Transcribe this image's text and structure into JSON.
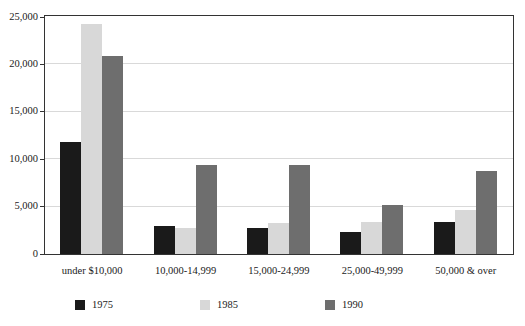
{
  "chart_data": {
    "type": "bar",
    "title": "",
    "xlabel": "",
    "ylabel": "",
    "categories": [
      "under $10,000",
      "10,000-14,999",
      "15,000-24,999",
      "25,000-49,999",
      "50,000 & over"
    ],
    "series": [
      {
        "name": "1975",
        "color": "#1a1a1a",
        "values": [
          11800,
          3000,
          2750,
          2350,
          3400
        ]
      },
      {
        "name": "1985",
        "color": "#d8d8d8",
        "values": [
          24300,
          2700,
          3250,
          3350,
          4600
        ]
      },
      {
        "name": "1990",
        "color": "#6e6e6e",
        "values": [
          20900,
          9400,
          9400,
          5200,
          8800
        ]
      }
    ],
    "ylim": [
      0,
      25000
    ],
    "yticks": [
      0,
      5000,
      10000,
      15000,
      20000,
      25000
    ],
    "ytick_labels": [
      "0",
      "5,000",
      "10,000",
      "15,000",
      "20,000",
      "25,000"
    ],
    "grid": true,
    "grid_axis": "y",
    "legend_position": "bottom",
    "legend_entries": [
      "1975",
      "1985",
      "1990"
    ]
  },
  "title_remnant": "",
  "colors": {
    "axis": "#333333",
    "grid": "#d9d9d9",
    "background": "#ffffff",
    "text": "#1a1a1a"
  }
}
